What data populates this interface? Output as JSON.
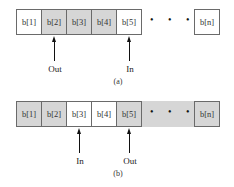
{
  "diagram_a": {
    "cells": [
      "b[1]",
      "b[2]",
      "b[3]",
      "b[4]",
      "b[5]"
    ],
    "shaded": [
      false,
      true,
      true,
      true,
      false
    ],
    "dots": "• • • •",
    "last_cell": "b[n]",
    "last_shaded": false,
    "pointers": [
      {
        "label": "Out",
        "cell": 2
      },
      {
        "label": "In",
        "cell": 5
      }
    ],
    "caption": "(a)"
  },
  "diagram_b": {
    "cells": [
      "b[1]",
      "b[2]",
      "b[3]",
      "b[4]",
      "b[5]"
    ],
    "shaded": [
      true,
      true,
      false,
      false,
      true
    ],
    "dots": "• • • •",
    "last_cell": "b[n]",
    "last_shaded": true,
    "pointers": [
      {
        "label": "In",
        "cell": 3
      },
      {
        "label": "Out",
        "cell": 5
      }
    ],
    "caption": "(b)"
  },
  "colors": {
    "shade": "#d6d6d6",
    "border": "#6a6a6a"
  }
}
